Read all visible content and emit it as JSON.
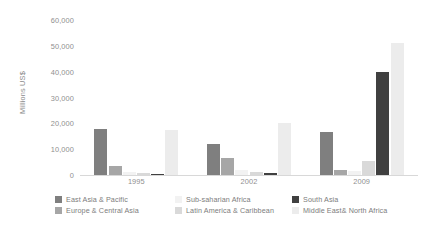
{
  "chart_data": {
    "type": "bar",
    "title": "",
    "xlabel": "",
    "ylabel": "Millions US$",
    "ylim": [
      0,
      60000
    ],
    "grid": false,
    "legend_position": "bottom",
    "categories": [
      "1995",
      "2002",
      "2009"
    ],
    "y_ticks": [
      "0",
      "10,000",
      "20,000",
      "30,000",
      "40,000",
      "50,000",
      "60,000"
    ],
    "y_tick_values": [
      0,
      10000,
      20000,
      30000,
      40000,
      50000,
      60000
    ],
    "series": [
      {
        "name": "East Asia & Pacific",
        "color": "#7f7f7f",
        "values": [
          18000,
          12000,
          16500
        ]
      },
      {
        "name": "Europe & Central Asia",
        "color": "#a6a6a6",
        "values": [
          3500,
          6500,
          2000
        ]
      },
      {
        "name": "Sub-saharian Africa",
        "color": "#f2f2f2",
        "values": [
          1000,
          1800,
          1500
        ]
      },
      {
        "name": "Latin America & Caribbean",
        "color": "#d9d9d9",
        "values": [
          700,
          1200,
          5500
        ]
      },
      {
        "name": "South Asia",
        "color": "#404040",
        "values": [
          500,
          800,
          40000
        ]
      },
      {
        "name": "Middle East& North Africa",
        "color": "#ececec",
        "values": [
          17500,
          20000,
          51000
        ]
      }
    ]
  },
  "axis": {
    "y_title": "Millions US$"
  }
}
